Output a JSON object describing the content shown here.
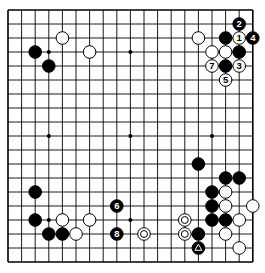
{
  "board": {
    "size": 19,
    "origin_x": 8,
    "origin_y": 10,
    "step_x": 13.6,
    "step_y": 14,
    "stone_radius": 6.3,
    "hoshi": [
      [
        3,
        3
      ],
      [
        9,
        3
      ],
      [
        15,
        3
      ],
      [
        3,
        9
      ],
      [
        9,
        9
      ],
      [
        15,
        9
      ],
      [
        3,
        15
      ],
      [
        9,
        15
      ],
      [
        15,
        15
      ]
    ],
    "stones": [
      {
        "c": 2,
        "r": 3,
        "color": "black"
      },
      {
        "c": 3,
        "r": 4,
        "color": "black"
      },
      {
        "c": 4,
        "r": 2,
        "color": "white"
      },
      {
        "c": 6,
        "r": 3,
        "color": "white"
      },
      {
        "c": 14,
        "r": 2,
        "color": "white"
      },
      {
        "c": 16,
        "r": 2,
        "color": "black"
      },
      {
        "c": 17,
        "r": 2,
        "color": "white",
        "label": "1"
      },
      {
        "c": 18,
        "r": 2,
        "color": "black",
        "label": "4"
      },
      {
        "c": 17,
        "r": 1,
        "color": "black",
        "label": "2"
      },
      {
        "c": 15,
        "r": 3,
        "color": "white"
      },
      {
        "c": 16,
        "r": 3,
        "color": "white"
      },
      {
        "c": 17,
        "r": 3,
        "color": "black"
      },
      {
        "c": 15,
        "r": 4,
        "color": "white",
        "label": "7"
      },
      {
        "c": 16,
        "r": 4,
        "color": "black"
      },
      {
        "c": 17,
        "r": 4,
        "color": "white",
        "label": "3"
      },
      {
        "c": 16,
        "r": 5,
        "color": "white",
        "label": "5"
      },
      {
        "c": 2,
        "r": 13,
        "color": "black"
      },
      {
        "c": 8,
        "r": 14,
        "color": "black",
        "label": "6"
      },
      {
        "c": 2,
        "r": 15,
        "color": "black"
      },
      {
        "c": 4,
        "r": 15,
        "color": "white"
      },
      {
        "c": 6,
        "r": 15,
        "color": "white"
      },
      {
        "c": 3,
        "r": 16,
        "color": "black"
      },
      {
        "c": 4,
        "r": 16,
        "color": "black"
      },
      {
        "c": 5,
        "r": 16,
        "color": "white"
      },
      {
        "c": 8,
        "r": 16,
        "color": "black",
        "label": "8"
      },
      {
        "c": 14,
        "r": 11,
        "color": "black"
      },
      {
        "c": 16,
        "r": 12,
        "color": "black"
      },
      {
        "c": 17,
        "r": 12,
        "color": "black"
      },
      {
        "c": 15,
        "r": 13,
        "color": "black"
      },
      {
        "c": 16,
        "r": 13,
        "color": "white"
      },
      {
        "c": 15,
        "r": 14,
        "color": "black"
      },
      {
        "c": 16,
        "r": 14,
        "color": "white"
      },
      {
        "c": 18,
        "r": 14,
        "color": "white"
      },
      {
        "c": 15,
        "r": 15,
        "color": "black"
      },
      {
        "c": 16,
        "r": 15,
        "color": "black"
      },
      {
        "c": 17,
        "r": 15,
        "color": "white"
      },
      {
        "c": 13,
        "r": 15,
        "color": "white",
        "mark": "circle"
      },
      {
        "c": 10,
        "r": 16,
        "color": "white",
        "mark": "circle"
      },
      {
        "c": 13,
        "r": 16,
        "color": "white",
        "mark": "circle"
      },
      {
        "c": 14,
        "r": 16,
        "color": "black"
      },
      {
        "c": 16,
        "r": 16,
        "color": "white"
      },
      {
        "c": 14,
        "r": 17,
        "color": "black",
        "mark": "triangle"
      },
      {
        "c": 17,
        "r": 17,
        "color": "white"
      }
    ]
  }
}
